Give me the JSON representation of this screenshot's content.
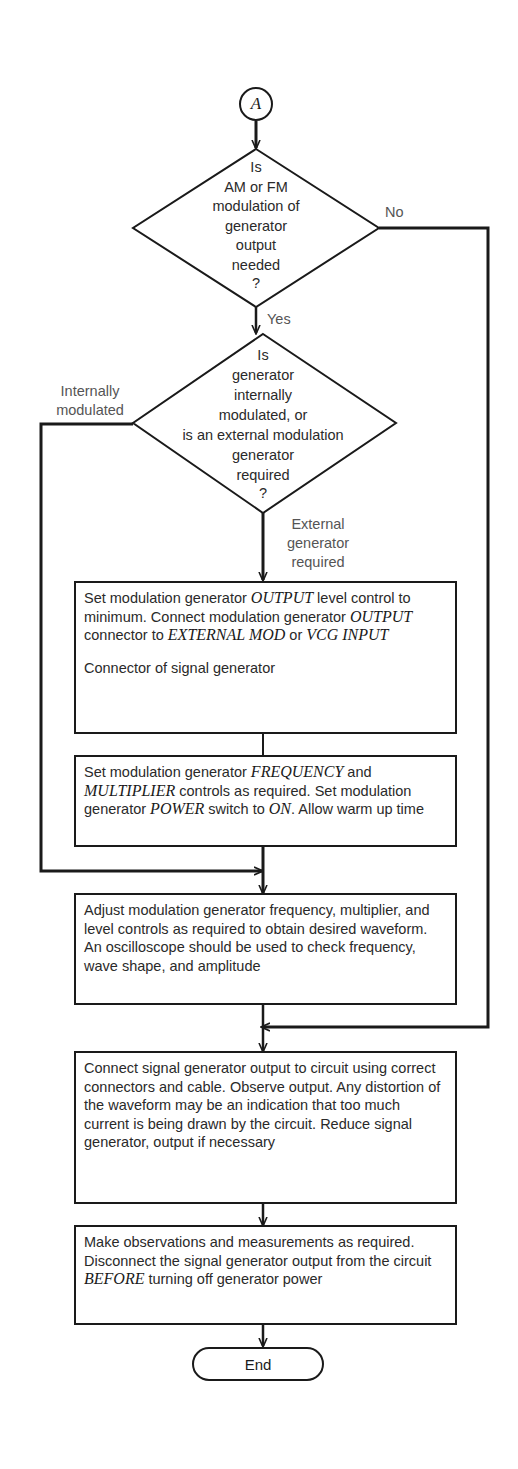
{
  "connector": {
    "label": "A"
  },
  "decision1": {
    "lines": [
      "Is",
      "AM or FM",
      "modulation of",
      "generator",
      "output",
      "needed",
      "?"
    ],
    "yes_label": "Yes",
    "no_label": "No"
  },
  "decision2": {
    "lines": [
      "Is",
      "generator",
      "internally",
      "modulated, or",
      "is an external modulation",
      "generator",
      "required",
      "?"
    ],
    "left_label": "Internally modulated",
    "left_label_lines": [
      "Internally",
      "modulated"
    ],
    "down_label_lines": [
      "External",
      "generator",
      "required"
    ]
  },
  "step1": {
    "t1": "Set modulation generator ",
    "k1": "OUTPUT",
    "t2": " level control to minimum. Connect modulation generator ",
    "k2": "OUTPUT",
    "t3": " connector to ",
    "k3": "EXTERNAL MOD",
    "t4": " or ",
    "k4": "VCG INPUT",
    "t5": "Connector of signal generator"
  },
  "step2": {
    "t1": "Set modulation generator ",
    "k1": "FREQUENCY",
    "t2": " and ",
    "k2": "MULTIPLIER",
    "t3": " controls as required. Set modulation generator ",
    "k3": "POWER",
    "t4": " switch to ",
    "k4": "ON",
    "t5": ". Allow warm up time"
  },
  "step3": {
    "text": "Adjust modulation generator frequency, multiplier, and level controls as required to obtain desired waveform. An oscilloscope should be used to check frequency, wave shape, and amplitude"
  },
  "step4": {
    "text": "Connect signal generator output to circuit using correct connectors and cable. Observe output. Any distortion of the waveform may be an indication that too much current is being drawn by the circuit. Reduce signal generator, output if necessary"
  },
  "step5": {
    "t1": "Make observations and measurements as required. Disconnect the signal generator output from the circuit ",
    "k1": "BEFORE",
    "t2": " turning off generator power"
  },
  "terminal": {
    "label": "End"
  }
}
